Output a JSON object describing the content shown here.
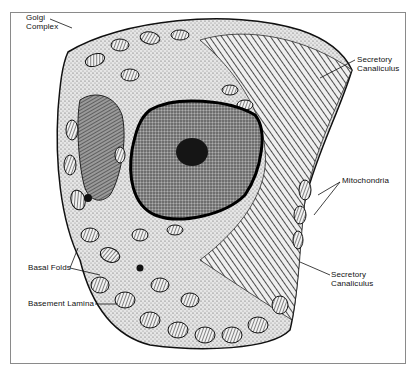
{
  "figure": {
    "labels": {
      "golgi": "Golgi\nComplex",
      "secretory_top": "Secretory\nCanaliculus",
      "mitochondria": "Mitochondria",
      "secretory_bottom": "Secretory\nCanaliculus",
      "basal_folds": "Basal Folds",
      "basement_lamina": "Basement Lamina"
    },
    "colors": {
      "ink": "#111111",
      "cytoplasm": "#d9d9d9",
      "nucleus": "#6b6b6b",
      "nucleolus": "#151515",
      "frame": "#8a8a8a"
    }
  }
}
